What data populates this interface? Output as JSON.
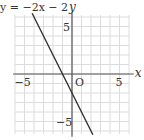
{
  "chart_data": {
    "type": "line",
    "xlabel": "x",
    "ylabel": "y",
    "origin_label": "O",
    "xlim": [
      -6,
      6
    ],
    "ylim": [
      -6.5,
      6.5
    ],
    "grid": true,
    "x_ticks": [
      {
        "value": -5,
        "label": "-5"
      },
      {
        "value": 5,
        "label": "5"
      }
    ],
    "y_ticks": [
      {
        "value": 5,
        "label": "5"
      },
      {
        "value": -5,
        "label": "-5"
      }
    ],
    "series": [
      {
        "name": "y = -2x - 2",
        "slope": -2,
        "intercept": -2,
        "x": [
          -4.2,
          -1,
          0,
          2.2
        ],
        "y": [
          6.4,
          0,
          -2,
          -6.4
        ]
      }
    ],
    "colors": {
      "grid": "#dcdcdc",
      "axis": "#555555",
      "line": "#333333"
    }
  }
}
